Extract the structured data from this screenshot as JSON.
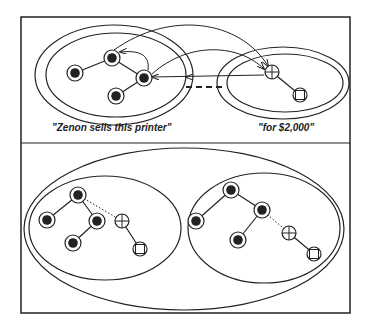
{
  "figure": {
    "top_panel": {
      "left_group_label": "\"Zenon sells this printer\"",
      "right_group_label": "\"for $2,000\""
    },
    "bottom_panel": {}
  },
  "legend_semantics": {
    "filled-node": "filled circle inside ring",
    "plus-node": "circle with cross",
    "square-node": "circle with square"
  },
  "colors": {
    "ink": "#222222",
    "background": "#ffffff"
  }
}
